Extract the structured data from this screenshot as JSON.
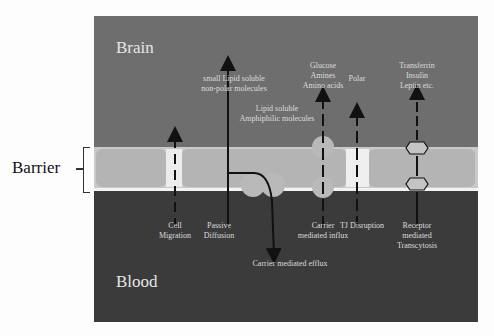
{
  "regions": {
    "brain": "Brain",
    "blood": "Blood",
    "barrier": "Barrier"
  },
  "upper_labels": {
    "small_lipid": [
      "small Lipid soluble",
      "non-polar molecules"
    ],
    "amphiphilic": [
      "Lipid soluble",
      "Amphiphilic molecules"
    ],
    "glucose": [
      "Glucose",
      "Amines",
      "Amino acids"
    ],
    "polar": [
      "Polar"
    ],
    "transferrin": [
      "Transferrin",
      "Insulin",
      "Leptin etc."
    ]
  },
  "lower_labels": {
    "cell_migration": [
      "Cell",
      "Migration"
    ],
    "passive_diffusion": [
      "Passive",
      "Diffusion"
    ],
    "carrier_efflux": [
      "Carrier mediated efflux"
    ],
    "carrier_influx": [
      "Carrier",
      "mediated influx"
    ],
    "tj_disruption": [
      "TJ Disruption"
    ],
    "receptor_transcytosis": [
      "Receptor",
      "mediated",
      "Transcytosis"
    ]
  },
  "colors": {
    "brain": "#6e6e6e",
    "barrier": "#c9c9c9",
    "blood": "#3b3b3b",
    "arrow": "#111111"
  }
}
